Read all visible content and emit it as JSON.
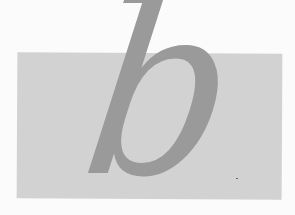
{
  "glyph": {
    "character": "b",
    "style": "italic serif"
  },
  "colors": {
    "background": "#fbfbfb",
    "panel": "#d2d2d2",
    "glyph": "#9a9a9a"
  }
}
